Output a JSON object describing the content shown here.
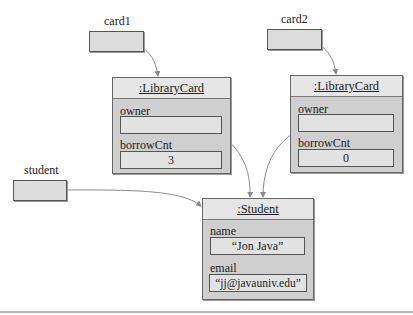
{
  "diagram": {
    "variables": [
      {
        "name": "card1",
        "points_to": "library_card_1"
      },
      {
        "name": "card2",
        "points_to": "library_card_2"
      },
      {
        "name": "student",
        "points_to": "student_object"
      }
    ],
    "objects": {
      "library_card_1": {
        "title": ":LibraryCard",
        "fields": [
          {
            "label": "owner",
            "value": "",
            "reference": "student_object"
          },
          {
            "label": "borrowCnt",
            "value": "3"
          }
        ]
      },
      "library_card_2": {
        "title": ":LibraryCard",
        "fields": [
          {
            "label": "owner",
            "value": "",
            "reference": "student_object"
          },
          {
            "label": "borrowCnt",
            "value": "0"
          }
        ]
      },
      "student_object": {
        "title": ":Student",
        "fields": [
          {
            "label": "name",
            "value": "“Jon Java”"
          },
          {
            "label": "email",
            "value": "“jj@javauniv.edu”"
          }
        ]
      }
    },
    "colors": {
      "object_fill": "#cfcfcf",
      "header_fill": "#e6e6e6",
      "field_fill": "#e2e2e2",
      "arrow": "#8a8a8a"
    }
  }
}
